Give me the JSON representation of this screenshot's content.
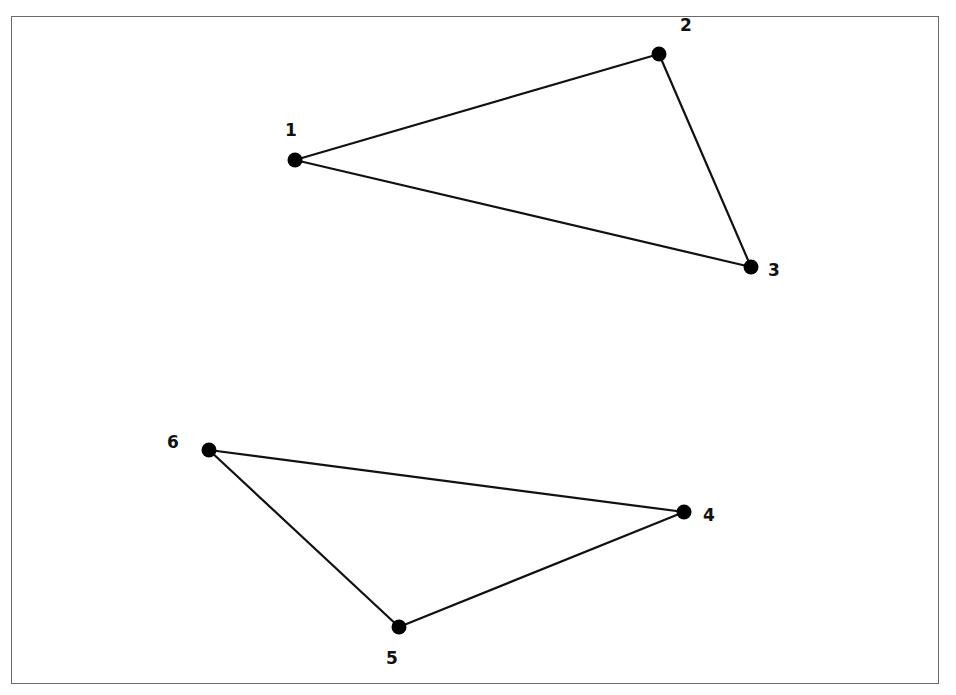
{
  "colors": {
    "line": "#111111",
    "vertex": "#000000",
    "frame": "#6b6b6b",
    "background": "#ffffff"
  },
  "vertices": [
    {
      "id": "1",
      "label": "1",
      "x": 295,
      "y": 160,
      "label_x": 285,
      "label_y": 122
    },
    {
      "id": "2",
      "label": "2",
      "x": 659,
      "y": 54,
      "label_x": 680,
      "label_y": 17
    },
    {
      "id": "3",
      "label": "3",
      "x": 751,
      "y": 267,
      "label_x": 768,
      "label_y": 262
    },
    {
      "id": "4",
      "label": "4",
      "x": 684,
      "y": 512,
      "label_x": 703,
      "label_y": 507
    },
    {
      "id": "5",
      "label": "5",
      "x": 399,
      "y": 627,
      "label_x": 386,
      "label_y": 650
    },
    {
      "id": "6",
      "label": "6",
      "x": 209,
      "y": 450,
      "label_x": 167,
      "label_y": 434
    }
  ],
  "edges": [
    {
      "from": "1",
      "to": "2"
    },
    {
      "from": "2",
      "to": "3"
    },
    {
      "from": "3",
      "to": "1"
    },
    {
      "from": "6",
      "to": "4"
    },
    {
      "from": "4",
      "to": "5"
    },
    {
      "from": "5",
      "to": "6"
    }
  ],
  "triangles": [
    {
      "name": "upper-triangle",
      "vertices": [
        "1",
        "2",
        "3"
      ]
    },
    {
      "name": "lower-triangle",
      "vertices": [
        "6",
        "4",
        "5"
      ]
    }
  ]
}
